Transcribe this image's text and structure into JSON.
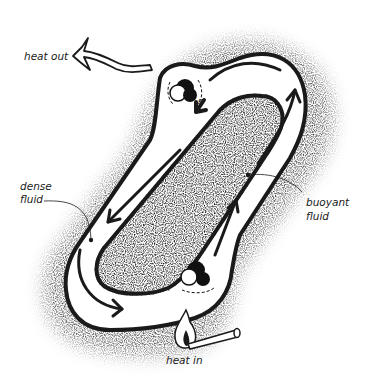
{
  "diagram": {
    "type": "thermosiphon convection loop",
    "labels": {
      "heat_out": "heat out",
      "heat_in": "heat in",
      "dense_fluid_line1": "dense",
      "dense_fluid_line2": "fluid",
      "buoyant_fluid_line1": "buoyant",
      "buoyant_fluid_line2": "fluid"
    },
    "markers": {
      "a": "A",
      "b": "B"
    },
    "components": [
      "closed tilted loop tube",
      "circulation arrows",
      "heat sink (top)",
      "heat source flame (bottom)",
      "match stick",
      "stippled insulation/shading"
    ],
    "colors": {
      "ink": "#1a1a1a",
      "background": "#ffffff",
      "stipple": "#8a8a8a"
    }
  }
}
